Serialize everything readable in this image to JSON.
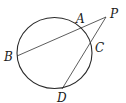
{
  "diagram": {
    "type": "circle-with-two-secants",
    "circle": {
      "cx": 54.5,
      "cy": 53,
      "rx": 37.5,
      "ry": 35.5,
      "stroke": "#2a2a2a"
    },
    "points": {
      "A": {
        "label": "A",
        "x": 78,
        "y": 28,
        "lx": 76,
        "ly": 23
      },
      "B": {
        "label": "B",
        "x": 17,
        "y": 56,
        "lx": 4,
        "ly": 61
      },
      "C": {
        "label": "C",
        "x": 90,
        "y": 45,
        "lx": 95,
        "ly": 52
      },
      "D": {
        "label": "D",
        "x": 62,
        "y": 89,
        "lx": 57,
        "ly": 102
      },
      "P": {
        "label": "P",
        "x": 106,
        "y": 17,
        "lx": 110,
        "ly": 18
      }
    },
    "segments": [
      {
        "from": "P",
        "to": "B"
      },
      {
        "from": "P",
        "to": "D"
      }
    ],
    "line_color": "#333333"
  }
}
